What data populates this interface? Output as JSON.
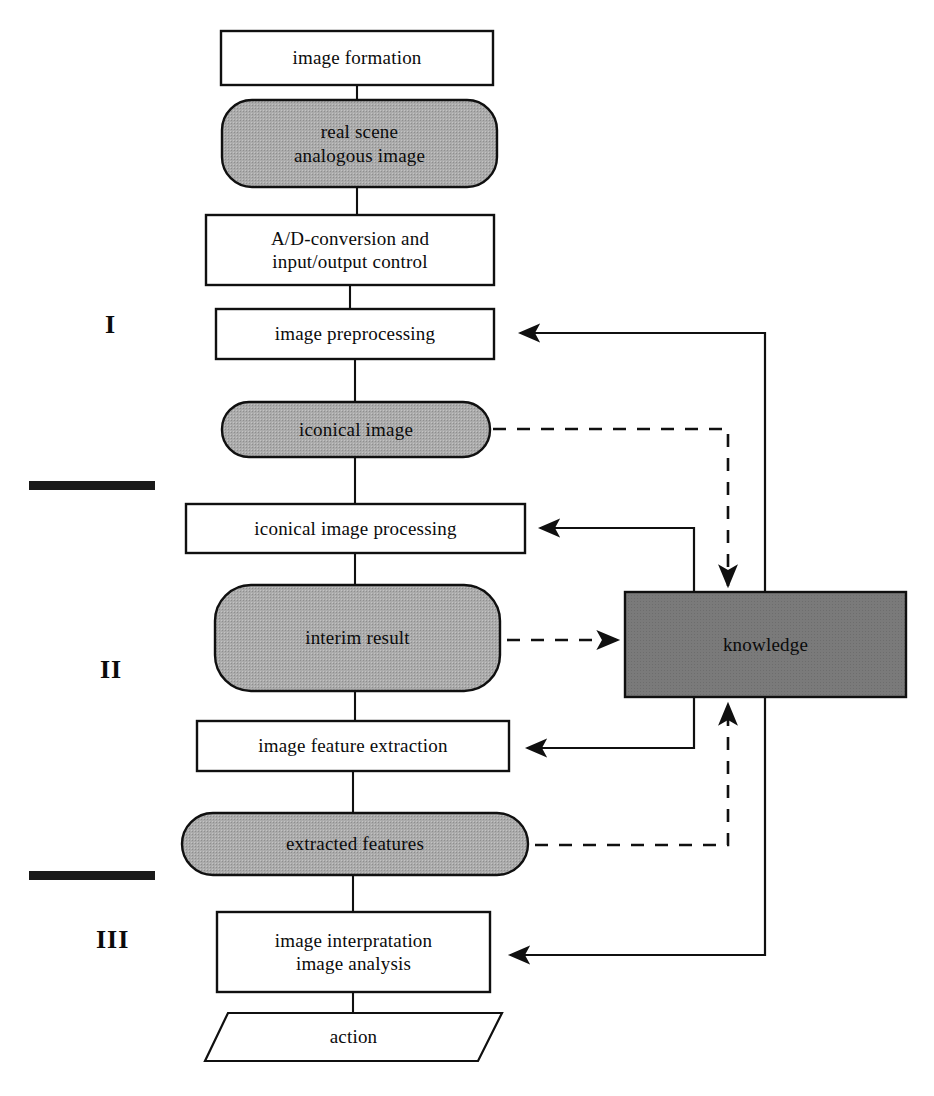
{
  "diagram": {
    "background_color": "#ffffff",
    "line_color": "#101010",
    "process_fill": "#ffffff",
    "data_fill": "#a8a8a8",
    "knowledge_fill": "#777777"
  },
  "stages": [
    {
      "id": "stage-1",
      "label": "I",
      "x": 105,
      "y": 310
    },
    {
      "id": "stage-2",
      "label": "II",
      "x": 100,
      "y": 655
    },
    {
      "id": "stage-3",
      "label": "III",
      "x": 96,
      "y": 925
    }
  ],
  "dividers": [
    {
      "id": "divider-1",
      "x": 29,
      "y": 481,
      "width": 126,
      "height": 9
    },
    {
      "id": "divider-2",
      "x": 29,
      "y": 871,
      "width": 126,
      "height": 9
    }
  ],
  "nodes": [
    {
      "id": "image-formation",
      "label": "image formation",
      "shape": "process",
      "x": 221,
      "y": 31,
      "w": 272,
      "h": 54
    },
    {
      "id": "real-scene-analogous-image",
      "label": "real scene\nanalogous image",
      "shape": "data",
      "x": 222,
      "y": 100,
      "w": 275,
      "h": 87
    },
    {
      "id": "ad-conversion",
      "label": "A/D-conversion and\ninput/output control",
      "shape": "process",
      "x": 206,
      "y": 215,
      "w": 288,
      "h": 70
    },
    {
      "id": "image-preprocessing",
      "label": "image preprocessing",
      "shape": "process",
      "x": 216,
      "y": 309,
      "w": 278,
      "h": 50
    },
    {
      "id": "iconical-image",
      "label": "iconical image",
      "shape": "data",
      "x": 222,
      "y": 402,
      "w": 268,
      "h": 55
    },
    {
      "id": "iconical-image-processing",
      "label": "iconical image processing",
      "shape": "process",
      "x": 186,
      "y": 504,
      "w": 339,
      "h": 49
    },
    {
      "id": "interim-result",
      "label": "interim result",
      "shape": "data",
      "x": 215,
      "y": 585,
      "w": 285,
      "h": 106
    },
    {
      "id": "image-feature-extraction",
      "label": "image feature extraction",
      "shape": "process",
      "x": 197,
      "y": 721,
      "w": 312,
      "h": 50
    },
    {
      "id": "extracted-features",
      "label": "extracted features",
      "shape": "data",
      "x": 182,
      "y": 813,
      "w": 346,
      "h": 62
    },
    {
      "id": "image-interpretation",
      "label": "image interpratation\nimage analysis",
      "shape": "process",
      "x": 217,
      "y": 912,
      "w": 273,
      "h": 80
    },
    {
      "id": "action",
      "label": "action",
      "shape": "parallelogram",
      "x": 205,
      "y": 1013,
      "w": 297,
      "h": 48
    },
    {
      "id": "knowledge",
      "label": "knowledge",
      "shape": "knowledge",
      "x": 625,
      "y": 592,
      "w": 281,
      "h": 105
    }
  ],
  "connectors": [
    {
      "id": "flow-formation-to-realscene",
      "type": "solid",
      "arrow": false
    },
    {
      "id": "flow-realscene-to-adconversion",
      "type": "solid",
      "arrow": false
    },
    {
      "id": "flow-adconversion-to-preprocess",
      "type": "solid",
      "arrow": false
    },
    {
      "id": "flow-preprocess-to-iconical",
      "type": "solid",
      "arrow": false
    },
    {
      "id": "flow-iconical-to-processing",
      "type": "solid",
      "arrow": false
    },
    {
      "id": "flow-processing-to-interim",
      "type": "solid",
      "arrow": false
    },
    {
      "id": "flow-interim-to-featureextract",
      "type": "solid",
      "arrow": false
    },
    {
      "id": "flow-featureextract-to-extracted",
      "type": "solid",
      "arrow": false
    },
    {
      "id": "flow-extracted-to-interpretation",
      "type": "solid",
      "arrow": false
    },
    {
      "id": "flow-interpretation-to-action",
      "type": "solid",
      "arrow": false
    },
    {
      "id": "feedback-knowledge-to-preprocess",
      "type": "solid",
      "arrow": true
    },
    {
      "id": "feedback-knowledge-to-iconproc",
      "type": "solid",
      "arrow": true
    },
    {
      "id": "feedback-knowledge-to-featureext",
      "type": "solid",
      "arrow": true
    },
    {
      "id": "feedback-knowledge-to-interpret",
      "type": "solid",
      "arrow": true
    },
    {
      "id": "dashed-iconical-to-knowledge",
      "type": "dashed",
      "arrow": true
    },
    {
      "id": "dashed-interim-to-knowledge",
      "type": "dashed",
      "arrow": true
    },
    {
      "id": "dashed-extracted-to-knowledge",
      "type": "dashed",
      "arrow": true
    }
  ]
}
